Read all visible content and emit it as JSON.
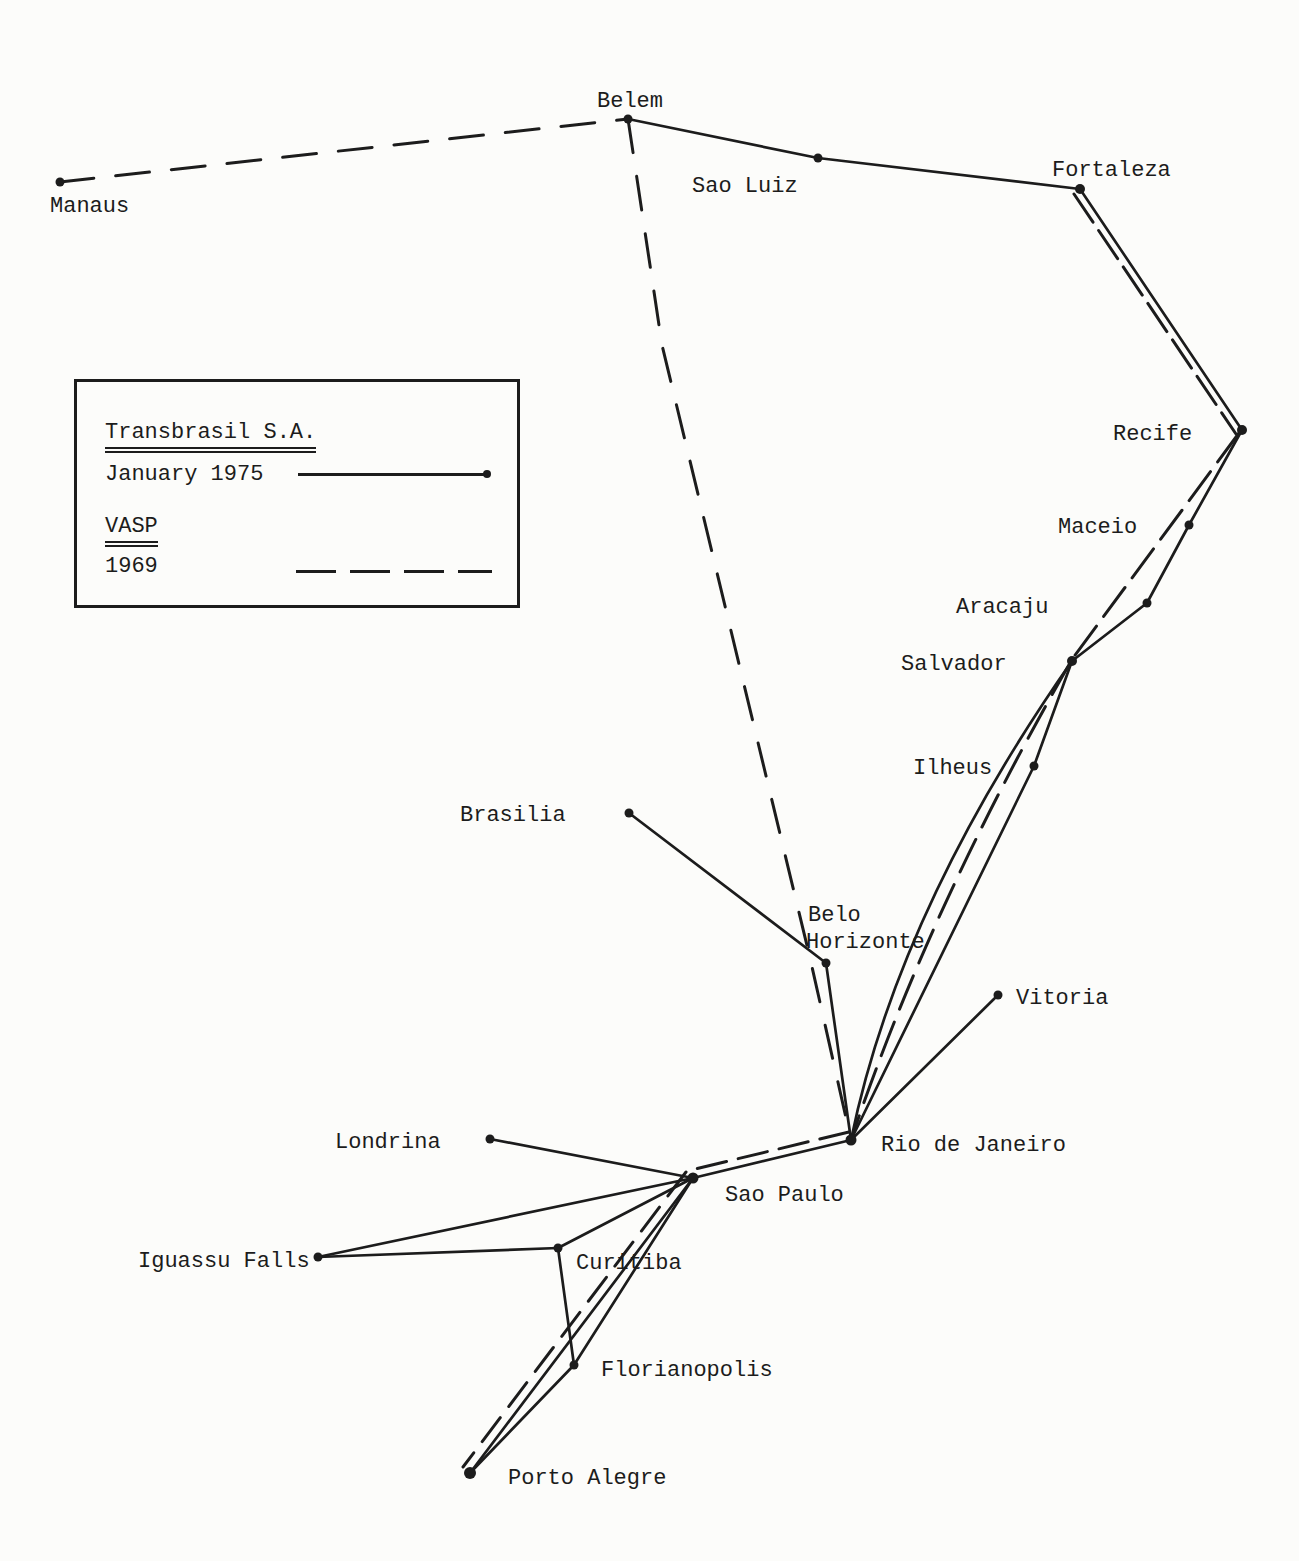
{
  "figure": {
    "kind": "airline-route-map",
    "region": "Brazil",
    "ink_color": "#1c1c1c",
    "paper_color": "#fcfcfa"
  },
  "legend": {
    "entries": [
      {
        "airline": "Transbrasil S.A.",
        "period": "January 1975",
        "line_style": "solid"
      },
      {
        "airline": "VASP",
        "period": "1969",
        "line_style": "dashed"
      }
    ]
  },
  "cities": [
    {
      "id": "manaus",
      "name": "Manaus",
      "x": 60,
      "y": 182,
      "r": 4.5,
      "label": [
        {
          "text": "Manaus",
          "x": 50,
          "y": 212
        }
      ]
    },
    {
      "id": "belem",
      "name": "Belem",
      "x": 628,
      "y": 119,
      "r": 4.5,
      "label": [
        {
          "text": "Belem",
          "x": 597,
          "y": 107
        }
      ]
    },
    {
      "id": "sao-luiz",
      "name": "Sao Luiz",
      "x": 818,
      "y": 158,
      "r": 4.5,
      "label": [
        {
          "text": "Sao Luiz",
          "x": 692,
          "y": 192
        }
      ]
    },
    {
      "id": "fortaleza",
      "name": "Fortaleza",
      "x": 1080,
      "y": 189,
      "r": 5,
      "label": [
        {
          "text": "Fortaleza",
          "x": 1052,
          "y": 176
        }
      ]
    },
    {
      "id": "recife",
      "name": "Recife",
      "x": 1242,
      "y": 430,
      "r": 5,
      "label": [
        {
          "text": "Recife",
          "x": 1113,
          "y": 440
        }
      ]
    },
    {
      "id": "maceio",
      "name": "Maceio",
      "x": 1189,
      "y": 525,
      "r": 4.5,
      "label": [
        {
          "text": "Maceio",
          "x": 1058,
          "y": 533
        }
      ]
    },
    {
      "id": "aracaju",
      "name": "Aracaju",
      "x": 1147,
      "y": 603,
      "r": 4.5,
      "label": [
        {
          "text": "Aracaju",
          "x": 956,
          "y": 613
        }
      ]
    },
    {
      "id": "salvador",
      "name": "Salvador",
      "x": 1072,
      "y": 661,
      "r": 5,
      "label": [
        {
          "text": "Salvador",
          "x": 901,
          "y": 670
        }
      ]
    },
    {
      "id": "ilheus",
      "name": "Ilheus",
      "x": 1034,
      "y": 766,
      "r": 4.5,
      "label": [
        {
          "text": "Ilheus",
          "x": 913,
          "y": 774
        }
      ]
    },
    {
      "id": "brasilia",
      "name": "Brasilia",
      "x": 629,
      "y": 813,
      "r": 4.5,
      "label": [
        {
          "text": "Brasilia",
          "x": 460,
          "y": 821
        }
      ]
    },
    {
      "id": "belo-horizonte",
      "name": "Belo Horizonte",
      "x": 826,
      "y": 963,
      "r": 4.5,
      "label": [
        {
          "text": "Belo",
          "x": 808,
          "y": 921
        },
        {
          "text": "Horizonte",
          "x": 806,
          "y": 948
        }
      ]
    },
    {
      "id": "vitoria",
      "name": "Vitoria",
      "x": 998,
      "y": 995,
      "r": 4.5,
      "label": [
        {
          "text": "Vitoria",
          "x": 1016,
          "y": 1004
        }
      ]
    },
    {
      "id": "rio-de-janeiro",
      "name": "Rio de Janeiro",
      "x": 851,
      "y": 1140,
      "r": 5.5,
      "label": [
        {
          "text": "Rio de Janeiro",
          "x": 881,
          "y": 1151
        }
      ]
    },
    {
      "id": "londrina",
      "name": "Londrina",
      "x": 490,
      "y": 1139,
      "r": 4.5,
      "label": [
        {
          "text": "Londrina",
          "x": 335,
          "y": 1148
        }
      ]
    },
    {
      "id": "sao-paulo",
      "name": "Sao Paulo",
      "x": 693,
      "y": 1178,
      "r": 5.5,
      "label": [
        {
          "text": "Sao Paulo",
          "x": 725,
          "y": 1201
        }
      ]
    },
    {
      "id": "iguassu-falls",
      "name": "Iguassu Falls",
      "x": 318,
      "y": 1257,
      "r": 4.5,
      "label": [
        {
          "text": "Iguassu Falls",
          "x": 138,
          "y": 1267
        }
      ]
    },
    {
      "id": "curitiba",
      "name": "Curitiba",
      "x": 558,
      "y": 1248,
      "r": 4.5,
      "label": [
        {
          "text": "Curitiba",
          "x": 576,
          "y": 1269
        }
      ]
    },
    {
      "id": "florianopolis",
      "name": "Florianopolis",
      "x": 574,
      "y": 1365,
      "r": 4.5,
      "label": [
        {
          "text": "Florianopolis",
          "x": 601,
          "y": 1376
        }
      ]
    },
    {
      "id": "porto-alegre",
      "name": "Porto Alegre",
      "x": 470,
      "y": 1473,
      "r": 6,
      "label": [
        {
          "text": "Porto Alegre",
          "x": 508,
          "y": 1484
        }
      ]
    }
  ],
  "routes": {
    "solid": [
      {
        "from": "belem",
        "to": "sao-luiz",
        "points": [
          [
            628,
            119
          ],
          [
            818,
            158
          ]
        ]
      },
      {
        "from": "sao-luiz",
        "to": "fortaleza",
        "points": [
          [
            818,
            158
          ],
          [
            1080,
            189
          ]
        ]
      },
      {
        "from": "fortaleza",
        "to": "recife",
        "points": [
          [
            1080,
            189
          ],
          [
            1242,
            430
          ]
        ]
      },
      {
        "from": "recife",
        "to": "maceio",
        "points": [
          [
            1242,
            430
          ],
          [
            1189,
            525
          ]
        ]
      },
      {
        "from": "maceio",
        "to": "aracaju",
        "points": [
          [
            1189,
            525
          ],
          [
            1147,
            603
          ]
        ]
      },
      {
        "from": "aracaju",
        "to": "salvador",
        "points": [
          [
            1147,
            603
          ],
          [
            1072,
            661
          ]
        ]
      },
      {
        "from": "salvador",
        "to": "ilheus",
        "points": [
          [
            1072,
            661
          ],
          [
            1034,
            766
          ]
        ]
      },
      {
        "from": "ilheus",
        "to": "rio-de-janeiro",
        "points": [
          [
            1034,
            766
          ],
          [
            851,
            1140
          ]
        ]
      },
      {
        "from": "salvador",
        "to": "rio-de-janeiro",
        "path": "M 1072 661 Q 898 910 851 1140"
      },
      {
        "from": "brasilia",
        "to": "belo-horizonte",
        "points": [
          [
            629,
            813
          ],
          [
            826,
            963
          ]
        ]
      },
      {
        "from": "belo-horizonte",
        "to": "rio-de-janeiro",
        "points": [
          [
            826,
            963
          ],
          [
            851,
            1140
          ]
        ]
      },
      {
        "from": "vitoria",
        "to": "rio-de-janeiro",
        "points": [
          [
            998,
            995
          ],
          [
            851,
            1140
          ]
        ]
      },
      {
        "from": "rio-de-janeiro",
        "to": "sao-paulo",
        "points": [
          [
            851,
            1140
          ],
          [
            693,
            1178
          ]
        ]
      },
      {
        "from": "londrina",
        "to": "sao-paulo",
        "points": [
          [
            490,
            1139
          ],
          [
            693,
            1178
          ]
        ]
      },
      {
        "from": "iguassu-falls",
        "to": "sao-paulo",
        "points": [
          [
            318,
            1257
          ],
          [
            693,
            1178
          ]
        ]
      },
      {
        "from": "iguassu-falls",
        "to": "curitiba",
        "points": [
          [
            318,
            1257
          ],
          [
            558,
            1248
          ]
        ]
      },
      {
        "from": "curitiba",
        "to": "sao-paulo",
        "points": [
          [
            558,
            1248
          ],
          [
            693,
            1178
          ]
        ]
      },
      {
        "from": "curitiba",
        "to": "florianopolis",
        "points": [
          [
            558,
            1248
          ],
          [
            574,
            1365
          ]
        ]
      },
      {
        "from": "sao-paulo",
        "to": "florianopolis",
        "points": [
          [
            693,
            1178
          ],
          [
            574,
            1365
          ]
        ]
      },
      {
        "from": "sao-paulo",
        "to": "porto-alegre",
        "points": [
          [
            693,
            1178
          ],
          [
            470,
            1473
          ]
        ]
      },
      {
        "from": "florianopolis",
        "to": "porto-alegre",
        "points": [
          [
            574,
            1365
          ],
          [
            470,
            1473
          ]
        ]
      }
    ],
    "dashed": [
      {
        "from": "manaus",
        "to": "belem",
        "points": [
          [
            60,
            182
          ],
          [
            628,
            119
          ]
        ],
        "dash": "34,22"
      },
      {
        "from": "belem",
        "to": "rio-de-janeiro",
        "points": [
          [
            628,
            119
          ],
          [
            662,
            345
          ],
          [
            810,
            958
          ],
          [
            851,
            1140
          ]
        ],
        "dash": "34,24"
      },
      {
        "from": "fortaleza",
        "to": "recife",
        "points": [
          [
            1074,
            194
          ],
          [
            1236,
            434
          ]
        ],
        "dash": "34,10"
      },
      {
        "from": "recife",
        "to": "salvador",
        "points": [
          [
            1239,
            433
          ],
          [
            1070,
            662
          ]
        ],
        "dash": "36,12"
      },
      {
        "from": "salvador",
        "to": "rio-de-janeiro",
        "path": "M 1070 663 Q 928 910 851 1140",
        "dash": "36,14"
      },
      {
        "from": "rio-de-janeiro",
        "to": "sao-paulo",
        "points": [
          [
            849,
            1132
          ],
          [
            691,
            1170
          ]
        ],
        "dash": "30,12"
      },
      {
        "from": "sao-paulo",
        "to": "porto-alegre",
        "points": [
          [
            686,
            1172
          ],
          [
            463,
            1467
          ]
        ],
        "dash": "30,14"
      }
    ]
  }
}
